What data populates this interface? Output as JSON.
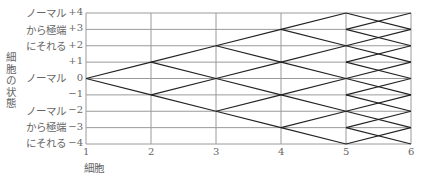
{
  "diagram": {
    "type": "state-transition-lattice",
    "y_axis": {
      "title": "細胞の状態",
      "ticks": [
        "+4",
        "+3",
        "+2",
        "+1",
        "0",
        "−1",
        "−2",
        "−3",
        "−4"
      ],
      "values": [
        4,
        3,
        2,
        1,
        0,
        -1,
        -2,
        -3,
        -4
      ],
      "range": [
        -4,
        4
      ]
    },
    "x_axis": {
      "title": "細胞",
      "ticks": [
        "1",
        "2",
        "3",
        "4",
        "5",
        "6"
      ],
      "values": [
        1,
        2,
        3,
        4,
        5,
        6
      ]
    },
    "state_labels": {
      "upper": [
        "ノーマル",
        "から極端",
        "にそれる"
      ],
      "middle": "ノーマル",
      "lower": [
        "ノーマル",
        "から極端",
        "にそれる"
      ]
    },
    "grid": true,
    "edges": [
      [
        1,
        0,
        2,
        1
      ],
      [
        1,
        0,
        2,
        -1
      ],
      [
        2,
        1,
        3,
        2
      ],
      [
        2,
        1,
        3,
        0
      ],
      [
        2,
        -1,
        3,
        0
      ],
      [
        2,
        -1,
        3,
        -2
      ],
      [
        3,
        2,
        4,
        3
      ],
      [
        3,
        2,
        4,
        1
      ],
      [
        3,
        0,
        4,
        1
      ],
      [
        3,
        0,
        4,
        -1
      ],
      [
        3,
        -2,
        4,
        -1
      ],
      [
        3,
        -2,
        4,
        -3
      ],
      [
        4,
        3,
        5,
        4
      ],
      [
        4,
        3,
        5,
        2
      ],
      [
        4,
        1,
        5,
        2
      ],
      [
        4,
        1,
        5,
        0
      ],
      [
        4,
        -1,
        5,
        0
      ],
      [
        4,
        -1,
        5,
        -2
      ],
      [
        4,
        -3,
        5,
        -2
      ],
      [
        4,
        -3,
        5,
        -4
      ],
      [
        5,
        4,
        6,
        3
      ],
      [
        5,
        2,
        6,
        3
      ],
      [
        5,
        2,
        6,
        1
      ],
      [
        5,
        0,
        6,
        1
      ],
      [
        5,
        0,
        6,
        -1
      ],
      [
        5,
        -2,
        6,
        -1
      ],
      [
        5,
        -2,
        6,
        -3
      ],
      [
        5,
        -4,
        6,
        -3
      ],
      [
        5,
        3,
        6,
        4
      ],
      [
        5,
        3,
        6,
        2
      ],
      [
        5,
        1,
        6,
        2
      ],
      [
        5,
        1,
        6,
        0
      ],
      [
        5,
        -1,
        6,
        0
      ],
      [
        5,
        -1,
        6,
        -2
      ],
      [
        5,
        -3,
        6,
        -2
      ],
      [
        5,
        -3,
        6,
        -4
      ]
    ],
    "colors": {
      "grid": "#9a9a9a",
      "edge": "#222222",
      "text": "#666666"
    }
  }
}
